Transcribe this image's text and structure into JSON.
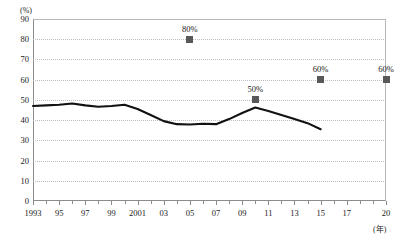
{
  "chart_data": {
    "type": "line",
    "title": "",
    "subtitle": "",
    "xlabel": "(年)",
    "ylabel": "(%)",
    "xlim": [
      1993,
      2020
    ],
    "ylim": [
      0,
      90
    ],
    "grid": true,
    "legend": "none",
    "y_ticks": [
      90,
      80,
      70,
      60,
      50,
      40,
      30,
      20,
      10,
      0
    ],
    "y_tick_labels": [
      "90",
      "80",
      "70",
      "60",
      "50",
      "40",
      "30",
      "20",
      "10",
      "0"
    ],
    "x_ticks": [
      1993,
      1995,
      1997,
      1999,
      2001,
      2003,
      2005,
      2007,
      2009,
      2011,
      2013,
      2015,
      2017,
      2020
    ],
    "x_tick_labels": [
      "1993",
      "95",
      "97",
      "99",
      "2001",
      "03",
      "05",
      "07",
      "09",
      "11",
      "13",
      "15",
      "17",
      "20"
    ],
    "series": [
      {
        "name": "trend-line",
        "type": "line",
        "color": "#111111",
        "x": [
          1993,
          1994,
          1995,
          1996,
          1997,
          1998,
          1999,
          2000,
          2001,
          2002,
          2003,
          2004,
          2005,
          2006,
          2007,
          2008,
          2009,
          2010,
          2011,
          2012,
          2013,
          2014,
          2015
        ],
        "values": [
          47,
          47.3,
          47.6,
          48.2,
          47.3,
          46.6,
          47,
          47.6,
          45.5,
          42.5,
          39.5,
          38,
          37.8,
          38.2,
          38,
          40.5,
          43.5,
          46.2,
          44.5,
          42.5,
          40.5,
          38.5,
          35.5
        ]
      },
      {
        "name": "target-markers",
        "type": "scatter",
        "color": "#595959",
        "x": [
          2005,
          2010,
          2015,
          2020
        ],
        "values": [
          80,
          50,
          60,
          60
        ],
        "data_labels": [
          "80%",
          "50%",
          "60%",
          "60%"
        ]
      }
    ]
  },
  "colors": {
    "line": "#111111",
    "marker": "#595959",
    "grid": "#bdbdbd",
    "axis": "#8c8c8c",
    "text": "#1a1a1a",
    "background": "#ffffff"
  }
}
